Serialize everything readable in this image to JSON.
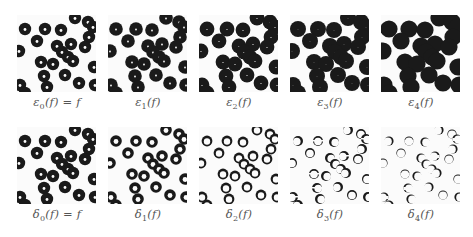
{
  "figure": {
    "rows": [
      {
        "name": "erosion-row",
        "panels": [
          {
            "label_main": "ε",
            "label_sub": "0",
            "label_tail": "(f) = f",
            "radius": 6.2,
            "hole": 1.4
          },
          {
            "label_main": "ε",
            "label_sub": "1",
            "label_tail": "(f)",
            "radius": 6.8,
            "hole": 0.9
          },
          {
            "label_main": "ε",
            "label_sub": "2",
            "label_tail": "(f)",
            "radius": 7.4,
            "hole": 0.6
          },
          {
            "label_main": "ε",
            "label_sub": "3",
            "label_tail": "(f)",
            "radius": 8.0,
            "hole": 0.3
          },
          {
            "label_main": "ε",
            "label_sub": "4",
            "label_tail": "(f)",
            "radius": 8.6,
            "hole": 0.0
          }
        ]
      },
      {
        "name": "dilation-row",
        "panels": [
          {
            "label_main": "δ",
            "label_sub": "0",
            "label_tail": "(f) = f",
            "radius": 6.2,
            "hole": 1.4
          },
          {
            "label_main": "δ",
            "label_sub": "1",
            "label_tail": "(f)",
            "radius": 5.8,
            "hole": 2.4
          },
          {
            "label_main": "δ",
            "label_sub": "2",
            "label_tail": "(f)",
            "radius": 5.4,
            "hole": 3.2
          },
          {
            "label_main": "δ",
            "label_sub": "3",
            "label_tail": "(f)",
            "radius": 5.0,
            "hole": 3.8
          },
          {
            "label_main": "δ",
            "label_sub": "4",
            "label_tail": "(f)",
            "radius": 4.6,
            "hole": 4.0
          }
        ]
      }
    ],
    "particles": [
      [
        8,
        14
      ],
      [
        28,
        14
      ],
      [
        44,
        15
      ],
      [
        58,
        3
      ],
      [
        71,
        7
      ],
      [
        76,
        12
      ],
      [
        72,
        22
      ],
      [
        20,
        26
      ],
      [
        40,
        31
      ],
      [
        54,
        29
      ],
      [
        68,
        32
      ],
      [
        45,
        37
      ],
      [
        51,
        42
      ],
      [
        24,
        47
      ],
      [
        36,
        49
      ],
      [
        56,
        46
      ],
      [
        77,
        52
      ],
      [
        27,
        61
      ],
      [
        48,
        60
      ],
      [
        62,
        68
      ],
      [
        30,
        72
      ],
      [
        3,
        70
      ],
      [
        2,
        36
      ],
      [
        78,
        70
      ],
      [
        8,
        78
      ]
    ]
  }
}
